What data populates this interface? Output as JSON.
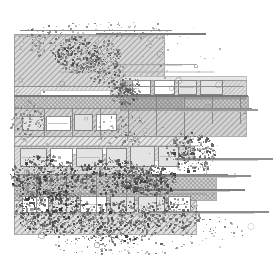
{
  "document": {
    "title": "Architectural Section Drawing",
    "kind": "technical-line-drawing",
    "width": 274,
    "height": 264,
    "background_color": "#ffffff",
    "ink_color": "#2b2b2b",
    "mid_gray": "#8a8a8a",
    "light_gray": "#c8c8c8",
    "hatch_color": "#9a9a9a",
    "description": "Monochrome architectural plan/section with 45-degree hatched bands, rectangular building footprints, thin horizontal datum lines extending to the right, and dense stippled noise concentrated in the lower-left and center."
  },
  "canvas": {
    "margin_left": 10,
    "margin_top": 20,
    "margin_right": 6,
    "margin_bottom": 12,
    "content_x": 12,
    "content_y": 22,
    "content_width": 256,
    "content_height": 232
  },
  "hatch_bands": [
    {
      "name": "band-upper-left-field",
      "x": 14,
      "y": 34,
      "w": 150,
      "h": 52,
      "tone": "#b6b6b6",
      "angle": 45
    },
    {
      "name": "band-upper-road",
      "x": 14,
      "y": 86,
      "w": 160,
      "h": 10,
      "tone": "#cfcfcf",
      "angle": 45
    },
    {
      "name": "band-upper-mid-strip",
      "x": 14,
      "y": 96,
      "w": 168,
      "h": 12,
      "tone": "#b0b0b0",
      "angle": 45
    },
    {
      "name": "band-main-terrace",
      "x": 14,
      "y": 108,
      "w": 232,
      "h": 28,
      "tone": "#adadad",
      "angle": 45
    },
    {
      "name": "band-right-upper-slab",
      "x": 120,
      "y": 80,
      "w": 126,
      "h": 16,
      "tone": "#c4c4c4",
      "angle": 45
    },
    {
      "name": "band-right-deck",
      "x": 120,
      "y": 96,
      "w": 128,
      "h": 14,
      "tone": "#a8a8a8",
      "angle": 45
    },
    {
      "name": "band-mid-plaza",
      "x": 14,
      "y": 136,
      "w": 176,
      "h": 10,
      "tone": "#d2d2d2",
      "angle": 45
    },
    {
      "name": "band-building-row",
      "x": 14,
      "y": 146,
      "w": 180,
      "h": 28,
      "tone": "#c9c9c9",
      "angle": 45
    },
    {
      "name": "band-lower-terrace",
      "x": 14,
      "y": 174,
      "w": 202,
      "h": 26,
      "tone": "#b4b4b4",
      "angle": 45
    },
    {
      "name": "band-lower-field",
      "x": 14,
      "y": 200,
      "w": 182,
      "h": 34,
      "tone": "#c6c6c6",
      "angle": 45
    }
  ],
  "solid_blocks": [
    {
      "name": "block-right-cornice",
      "x": 122,
      "y": 76,
      "w": 124,
      "h": 4,
      "tone": "#e6e6e6"
    },
    {
      "name": "block-right-facade",
      "x": 126,
      "y": 96,
      "w": 120,
      "h": 3,
      "tone": "#9b9b9b"
    },
    {
      "name": "block-white-gap-a",
      "x": 40,
      "y": 90,
      "w": 70,
      "h": 5,
      "tone": "#ffffff"
    },
    {
      "name": "block-white-gap-b",
      "x": 60,
      "y": 148,
      "w": 60,
      "h": 6,
      "tone": "#ffffff"
    },
    {
      "name": "block-white-gap-c",
      "x": 150,
      "y": 160,
      "w": 56,
      "h": 14,
      "tone": "#ffffff"
    }
  ],
  "rooms": [
    {
      "name": "room-a",
      "x": 22,
      "y": 116,
      "w": 22,
      "h": 14
    },
    {
      "name": "room-b",
      "x": 46,
      "y": 116,
      "w": 24,
      "h": 14
    },
    {
      "name": "room-c",
      "x": 74,
      "y": 114,
      "w": 18,
      "h": 16
    },
    {
      "name": "room-d",
      "x": 96,
      "y": 114,
      "w": 20,
      "h": 16
    },
    {
      "name": "room-e",
      "x": 20,
      "y": 148,
      "w": 26,
      "h": 18
    },
    {
      "name": "room-f",
      "x": 50,
      "y": 148,
      "w": 22,
      "h": 18
    },
    {
      "name": "room-g",
      "x": 76,
      "y": 148,
      "w": 26,
      "h": 18
    },
    {
      "name": "room-h",
      "x": 106,
      "y": 148,
      "w": 20,
      "h": 18
    },
    {
      "name": "room-i",
      "x": 130,
      "y": 146,
      "w": 24,
      "h": 20
    },
    {
      "name": "room-j",
      "x": 158,
      "y": 146,
      "w": 20,
      "h": 20
    },
    {
      "name": "room-k",
      "x": 132,
      "y": 80,
      "w": 18,
      "h": 14
    },
    {
      "name": "room-l",
      "x": 154,
      "y": 80,
      "w": 20,
      "h": 14
    },
    {
      "name": "room-m",
      "x": 178,
      "y": 80,
      "w": 18,
      "h": 14
    },
    {
      "name": "room-n",
      "x": 200,
      "y": 80,
      "w": 22,
      "h": 14
    },
    {
      "name": "room-o",
      "x": 22,
      "y": 196,
      "w": 26,
      "h": 16
    },
    {
      "name": "room-p",
      "x": 52,
      "y": 196,
      "w": 24,
      "h": 16
    },
    {
      "name": "room-q",
      "x": 80,
      "y": 196,
      "w": 26,
      "h": 16
    },
    {
      "name": "room-r",
      "x": 110,
      "y": 196,
      "w": 24,
      "h": 16
    },
    {
      "name": "room-s",
      "x": 138,
      "y": 196,
      "w": 26,
      "h": 16
    },
    {
      "name": "room-t",
      "x": 168,
      "y": 196,
      "w": 22,
      "h": 16
    }
  ],
  "datum_lines": [
    {
      "name": "datum-top-1",
      "x1": 20,
      "y1": 30,
      "x2": 172,
      "y2": 30,
      "weight": 1.0,
      "tone": "#8e8e8e"
    },
    {
      "name": "datum-top-2",
      "x1": 18,
      "y1": 36,
      "x2": 150,
      "y2": 36,
      "weight": 0.8,
      "tone": "#a0a0a0"
    },
    {
      "name": "datum-top-3",
      "x1": 96,
      "y1": 34,
      "x2": 206,
      "y2": 34,
      "weight": 1.2,
      "tone": "#7a7a7a"
    },
    {
      "name": "datum-mid-1",
      "x1": 14,
      "y1": 86,
      "x2": 244,
      "y2": 86,
      "weight": 1.0,
      "tone": "#8e8e8e"
    },
    {
      "name": "datum-mid-2",
      "x1": 14,
      "y1": 96,
      "x2": 248,
      "y2": 96,
      "weight": 1.2,
      "tone": "#777777"
    },
    {
      "name": "datum-mid-3",
      "x1": 14,
      "y1": 108,
      "x2": 252,
      "y2": 108,
      "weight": 1.0,
      "tone": "#8a8a8a"
    },
    {
      "name": "datum-mid-4",
      "x1": 60,
      "y1": 72,
      "x2": 214,
      "y2": 72,
      "weight": 0.8,
      "tone": "#a8a8a8"
    },
    {
      "name": "datum-low-1",
      "x1": 14,
      "y1": 136,
      "x2": 196,
      "y2": 136,
      "weight": 1.0,
      "tone": "#8e8e8e"
    },
    {
      "name": "datum-low-2",
      "x1": 14,
      "y1": 146,
      "x2": 200,
      "y2": 146,
      "weight": 0.8,
      "tone": "#9c9c9c"
    },
    {
      "name": "datum-low-3",
      "x1": 14,
      "y1": 174,
      "x2": 228,
      "y2": 174,
      "weight": 1.0,
      "tone": "#858585"
    },
    {
      "name": "datum-low-4",
      "x1": 14,
      "y1": 194,
      "x2": 206,
      "y2": 194,
      "weight": 0.9,
      "tone": "#909090"
    },
    {
      "name": "datum-low-5",
      "x1": 14,
      "y1": 214,
      "x2": 190,
      "y2": 214,
      "weight": 0.8,
      "tone": "#9a9a9a"
    }
  ],
  "extension_lines": [
    {
      "name": "extension-line-1",
      "x1": 176,
      "y1": 159,
      "x2": 272,
      "y2": 159,
      "tone": "#8e8e8e",
      "weight": 1.4
    },
    {
      "name": "extension-line-2",
      "x1": 150,
      "y1": 176,
      "x2": 250,
      "y2": 176,
      "tone": "#8e8e8e",
      "weight": 1.4
    },
    {
      "name": "extension-line-3",
      "x1": 140,
      "y1": 190,
      "x2": 244,
      "y2": 190,
      "tone": "#7e7e7e",
      "weight": 1.4
    },
    {
      "name": "extension-line-4",
      "x1": 150,
      "y1": 212,
      "x2": 268,
      "y2": 212,
      "tone": "#8e8e8e",
      "weight": 1.4
    },
    {
      "name": "extension-line-5",
      "x1": 176,
      "y1": 110,
      "x2": 258,
      "y2": 110,
      "tone": "#9a9a9a",
      "weight": 1.2
    },
    {
      "name": "extension-line-6",
      "x1": 116,
      "y1": 64,
      "x2": 196,
      "y2": 64,
      "tone": "#a4a4a4",
      "weight": 1.0
    }
  ],
  "vertical_ticks": [
    {
      "name": "tick-a",
      "x": 44,
      "y1": 108,
      "y2": 136
    },
    {
      "name": "tick-b",
      "x": 72,
      "y1": 108,
      "y2": 136
    },
    {
      "name": "tick-c",
      "x": 100,
      "y1": 108,
      "y2": 136
    },
    {
      "name": "tick-d",
      "x": 128,
      "y1": 108,
      "y2": 136
    },
    {
      "name": "tick-e",
      "x": 156,
      "y1": 96,
      "y2": 136
    },
    {
      "name": "tick-f",
      "x": 184,
      "y1": 96,
      "y2": 136
    },
    {
      "name": "tick-g",
      "x": 212,
      "y1": 96,
      "y2": 124
    },
    {
      "name": "tick-h",
      "x": 240,
      "y1": 96,
      "y2": 124
    },
    {
      "name": "tick-i",
      "x": 36,
      "y1": 174,
      "y2": 214
    },
    {
      "name": "tick-j",
      "x": 66,
      "y1": 174,
      "y2": 214
    },
    {
      "name": "tick-k",
      "x": 96,
      "y1": 174,
      "y2": 214
    },
    {
      "name": "tick-l",
      "x": 126,
      "y1": 174,
      "y2": 214
    },
    {
      "name": "tick-m",
      "x": 156,
      "y1": 174,
      "y2": 214
    }
  ],
  "stipple_clusters": [
    {
      "name": "cluster-top-left",
      "cx": 46,
      "cy": 40,
      "rx": 30,
      "ry": 16,
      "count": 170,
      "density": 0.55,
      "darkness": 0.55,
      "seed": 101
    },
    {
      "name": "cluster-top-mid",
      "cx": 92,
      "cy": 30,
      "rx": 34,
      "ry": 12,
      "count": 130,
      "density": 0.45,
      "darkness": 0.45,
      "seed": 202
    },
    {
      "name": "cluster-top-right",
      "cx": 140,
      "cy": 30,
      "rx": 28,
      "ry": 12,
      "count": 110,
      "density": 0.4,
      "darkness": 0.4,
      "seed": 303
    },
    {
      "name": "cluster-foliage-a",
      "cx": 76,
      "cy": 54,
      "rx": 22,
      "ry": 18,
      "count": 300,
      "density": 0.8,
      "darkness": 0.8,
      "seed": 404
    },
    {
      "name": "cluster-foliage-b",
      "cx": 104,
      "cy": 62,
      "rx": 18,
      "ry": 22,
      "count": 260,
      "density": 0.72,
      "darkness": 0.7,
      "seed": 505
    },
    {
      "name": "cluster-foliage-c",
      "cx": 124,
      "cy": 88,
      "rx": 16,
      "ry": 16,
      "count": 230,
      "density": 0.7,
      "darkness": 0.72,
      "seed": 606
    },
    {
      "name": "cluster-scatter-right",
      "cx": 180,
      "cy": 46,
      "rx": 42,
      "ry": 26,
      "count": 90,
      "density": 0.18,
      "darkness": 0.35,
      "seed": 707
    },
    {
      "name": "cluster-mid-left",
      "cx": 28,
      "cy": 120,
      "rx": 18,
      "ry": 20,
      "count": 180,
      "density": 0.55,
      "darkness": 0.55,
      "seed": 808
    },
    {
      "name": "cluster-mid-center",
      "cx": 120,
      "cy": 130,
      "rx": 28,
      "ry": 18,
      "count": 200,
      "density": 0.5,
      "darkness": 0.5,
      "seed": 909
    },
    {
      "name": "cluster-mid-right",
      "cx": 190,
      "cy": 152,
      "rx": 26,
      "ry": 20,
      "count": 320,
      "density": 0.78,
      "darkness": 0.78,
      "seed": 111
    },
    {
      "name": "cluster-heavy-a",
      "cx": 44,
      "cy": 178,
      "rx": 34,
      "ry": 24,
      "count": 520,
      "density": 0.88,
      "darkness": 0.88,
      "seed": 121
    },
    {
      "name": "cluster-heavy-b",
      "cx": 110,
      "cy": 176,
      "rx": 38,
      "ry": 18,
      "count": 460,
      "density": 0.82,
      "darkness": 0.85,
      "seed": 131
    },
    {
      "name": "cluster-heavy-c",
      "cx": 150,
      "cy": 180,
      "rx": 26,
      "ry": 16,
      "count": 380,
      "density": 0.8,
      "darkness": 0.86,
      "seed": 141
    },
    {
      "name": "cluster-heavy-d",
      "cx": 52,
      "cy": 212,
      "rx": 38,
      "ry": 24,
      "count": 540,
      "density": 0.85,
      "darkness": 0.88,
      "seed": 151
    },
    {
      "name": "cluster-heavy-e",
      "cx": 118,
      "cy": 222,
      "rx": 42,
      "ry": 22,
      "count": 480,
      "density": 0.8,
      "darkness": 0.86,
      "seed": 161
    },
    {
      "name": "cluster-heavy-f",
      "cx": 170,
      "cy": 214,
      "rx": 30,
      "ry": 18,
      "count": 300,
      "density": 0.65,
      "darkness": 0.78,
      "seed": 171
    },
    {
      "name": "cluster-tail-bottom",
      "cx": 120,
      "cy": 244,
      "rx": 66,
      "ry": 12,
      "count": 220,
      "density": 0.3,
      "darkness": 0.6,
      "seed": 181
    },
    {
      "name": "cluster-tail-right",
      "cx": 214,
      "cy": 232,
      "rx": 34,
      "ry": 16,
      "count": 120,
      "density": 0.22,
      "darkness": 0.5,
      "seed": 191
    },
    {
      "name": "cluster-sparse-field",
      "cx": 132,
      "cy": 132,
      "rx": 120,
      "ry": 108,
      "count": 340,
      "density": 0.1,
      "darkness": 0.3,
      "seed": 212
    }
  ],
  "rings": {
    "name": "ring-markers",
    "count": 34,
    "seed": 333,
    "tone": "#8a8a8a",
    "radius_min": 1.2,
    "radius_max": 3.2,
    "area": {
      "x": 16,
      "y": 26,
      "w": 244,
      "h": 224
    }
  },
  "legend": {
    "hatch_label": "45° section hatch",
    "ink_label": "ink / stipple",
    "visible": false
  }
}
